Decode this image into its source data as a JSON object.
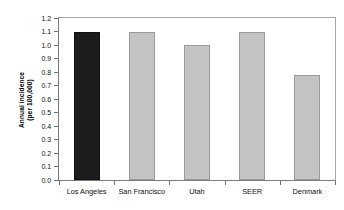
{
  "chart_data": {
    "type": "bar",
    "title": "",
    "subtitle": "",
    "xlabel": "",
    "ylabel": "Annual incidence (per 100,000)",
    "ylabel_line1": "Annual incidence",
    "ylabel_line2": "(per 100,000)",
    "categories": [
      "Los Angeles",
      "San Francisco",
      "Utah",
      "SEER",
      "Denmark"
    ],
    "values": [
      1.1,
      1.1,
      1.0,
      1.1,
      0.78
    ],
    "ylim": [
      0.0,
      1.2
    ],
    "ytick_step": 0.1,
    "ytick_labels": [
      "1.2",
      "1.1",
      "1.0",
      "0.9",
      "0.8",
      "0.7",
      "0.6",
      "0.5",
      "0.4",
      "0.3",
      "0.2",
      "0.1",
      "0.0"
    ],
    "ytick_values": [
      1.2,
      1.1,
      1.0,
      0.9,
      0.8,
      0.7,
      0.6,
      0.5,
      0.4,
      0.3,
      0.2,
      0.1,
      0.0
    ],
    "grid": false,
    "legend": null,
    "legend_position": "none",
    "bar_colors": [
      "#1c1c1c",
      "#c4c4c4",
      "#c4c4c4",
      "#c4c4c4",
      "#c4c4c4"
    ],
    "highlight_category": "Los Angeles",
    "colors": {
      "highlight_bar": "#1c1c1c",
      "bar": "#c4c4c4",
      "bar_border": "#9a9a9a",
      "axis": "#7a7a7a",
      "frame": "#a6a6a6",
      "text": "#111111",
      "background": "#ffffff"
    }
  }
}
